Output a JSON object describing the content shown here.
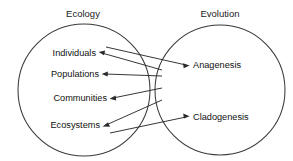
{
  "diagram": {
    "type": "venn-style two-circle concept map",
    "background_color": "#ffffff",
    "stroke_color": "#2b2b2b",
    "circle_stroke_color": "#3a3a3a",
    "text_color": "#111111"
  },
  "groups": {
    "left": {
      "title": "Ecology",
      "title_x": 83,
      "title_y": 17,
      "circle": {
        "cx": 84,
        "cy": 90,
        "r": 66
      },
      "items": [
        {
          "label": "Individuals",
          "x": 96,
          "y": 56,
          "anchor_x": 99,
          "anchor_y": 53
        },
        {
          "label": "Populations",
          "x": 99,
          "y": 77,
          "anchor_x": 102,
          "anchor_y": 74
        },
        {
          "label": "Communities",
          "x": 107,
          "y": 101,
          "anchor_x": 110,
          "anchor_y": 98
        },
        {
          "label": "Ecosystems",
          "x": 100,
          "y": 128,
          "anchor_x": 103,
          "anchor_y": 125
        }
      ]
    },
    "right": {
      "title": "Evolution",
      "title_x": 220,
      "title_y": 17,
      "circle": {
        "cx": 220,
        "cy": 90,
        "r": 65
      },
      "items": [
        {
          "label": "Anagenesis",
          "x": 193,
          "y": 68,
          "anchor_x": 190,
          "anchor_y": 65
        },
        {
          "label": "Cladogenesis",
          "x": 193,
          "y": 120,
          "anchor_x": 190,
          "anchor_y": 117
        }
      ]
    }
  },
  "connections": [
    {
      "from": "Individuals",
      "to": "Anagenesis",
      "direction": "to-right"
    },
    {
      "from": "Anagenesis",
      "to": "Individuals",
      "direction": "to-left"
    },
    {
      "from": "Anagenesis",
      "to": "Populations",
      "direction": "to-left"
    },
    {
      "from": "Anagenesis",
      "to": "Communities",
      "direction": "to-left"
    },
    {
      "from": "Ecosystems",
      "to": "Cladogenesis",
      "direction": "to-right"
    },
    {
      "from": "Cladogenesis",
      "to": "Ecosystems",
      "direction": "to-left"
    }
  ],
  "convergence": {
    "x": 162,
    "y_top": 68,
    "y_bottom": 114
  }
}
